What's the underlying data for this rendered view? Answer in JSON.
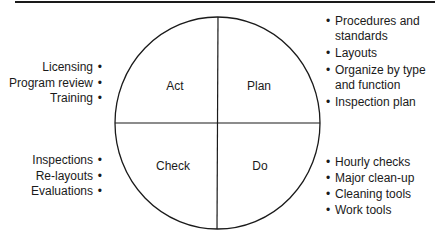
{
  "diagram": {
    "type": "pdca-cycle",
    "quadrants": [
      {
        "id": "act",
        "label": "Act",
        "position": "top-left"
      },
      {
        "id": "plan",
        "label": "Plan",
        "position": "top-right"
      },
      {
        "id": "check",
        "label": "Check",
        "position": "bottom-left"
      },
      {
        "id": "do",
        "label": "Do",
        "position": "bottom-right"
      }
    ],
    "act_items": [
      "Licensing",
      "Program review",
      "Training"
    ],
    "plan_items": [
      "Procedures and standards",
      "Layouts",
      "Organize by type and function",
      "Inspection plan"
    ],
    "check_items": [
      "Inspections",
      "Re-layouts",
      "Evaluations"
    ],
    "do_items": [
      "Hourly checks",
      "Major clean-up",
      "Cleaning tools",
      "Work tools"
    ],
    "colors": {
      "line": "#1a1a1a",
      "background": "#ffffff"
    }
  }
}
